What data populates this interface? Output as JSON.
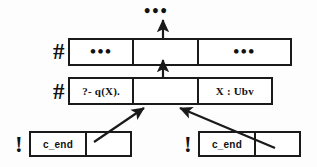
{
  "diagram": {
    "top_dots": "•••",
    "ink_color": "#1a1a1a",
    "background_color": "#fdfdfd",
    "rows": [
      {
        "id": "top-row",
        "marker": "#",
        "marker_name": "hash-marker",
        "cells": [
          {
            "id": "top-cell-left",
            "text": "•••",
            "style": "ellipsis"
          },
          {
            "id": "top-cell-middle",
            "text": "",
            "style": "empty"
          },
          {
            "id": "top-cell-right",
            "text": "•••",
            "style": "ellipsis"
          }
        ]
      },
      {
        "id": "middle-row",
        "marker": "#",
        "marker_name": "hash-marker",
        "cells": [
          {
            "id": "middle-cell-goal",
            "text": "?- q(X).",
            "style": "text"
          },
          {
            "id": "middle-cell-middle",
            "text": "",
            "style": "empty"
          },
          {
            "id": "middle-cell-binding",
            "text": "X : Ubv",
            "style": "text"
          }
        ]
      },
      {
        "id": "bottom-left-row",
        "marker": "!",
        "marker_name": "bang-marker",
        "cells": [
          {
            "id": "bottom-left-cell-label",
            "text": "c_end",
            "style": "mono"
          },
          {
            "id": "bottom-left-cell-empty",
            "text": "",
            "style": "empty"
          }
        ]
      },
      {
        "id": "bottom-right-row",
        "marker": "!",
        "marker_name": "bang-marker",
        "cells": [
          {
            "id": "bottom-right-cell-label",
            "text": "c_end",
            "style": "mono"
          },
          {
            "id": "bottom-right-cell-empty",
            "text": "",
            "style": "empty"
          }
        ]
      }
    ],
    "arrows": [
      {
        "id": "arrow-top",
        "from": "top-row-middle-cell",
        "to": "top-dots",
        "kind": "vertical"
      },
      {
        "id": "arrow-middle-to-top",
        "from": "middle-row-middle-cell",
        "to": "top-row-middle-cell",
        "kind": "vertical"
      },
      {
        "id": "arrow-bottom-left",
        "from": "bottom-left-cell-empty",
        "to": "middle-cell-middle",
        "kind": "diagonal"
      },
      {
        "id": "arrow-bottom-right",
        "from": "bottom-right-cell-empty",
        "to": "middle-cell-middle",
        "kind": "diagonal"
      }
    ]
  }
}
